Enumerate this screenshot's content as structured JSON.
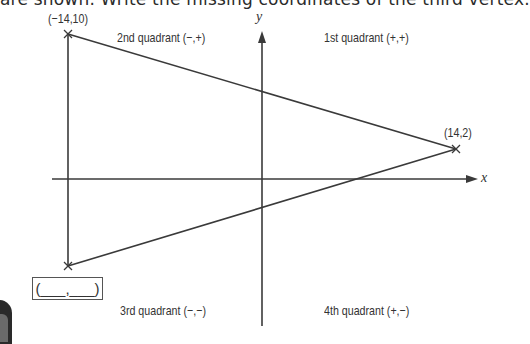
{
  "instruction": {
    "text": "are shown. Write the missing coordinates of the third vertex."
  },
  "axes": {
    "x_label": "x",
    "y_label": "y"
  },
  "quadrants": {
    "first": "1st quadrant (+,+)",
    "second": "2nd quadrant (−,+)",
    "third": "3rd quadrant (−,−)",
    "fourth": "4th quadrant (+,−)"
  },
  "vertices": [
    {
      "label": "(−14,10)",
      "x": -14,
      "y": 10
    },
    {
      "label": "(14,2)",
      "x": 14,
      "y": 2
    },
    {
      "label": "missing",
      "x": null,
      "y": null
    }
  ],
  "answer_box": {
    "text": "(___,___)"
  },
  "colors": {
    "line": "#3a3a3a",
    "text": "#333333",
    "background": "#ffffff"
  }
}
